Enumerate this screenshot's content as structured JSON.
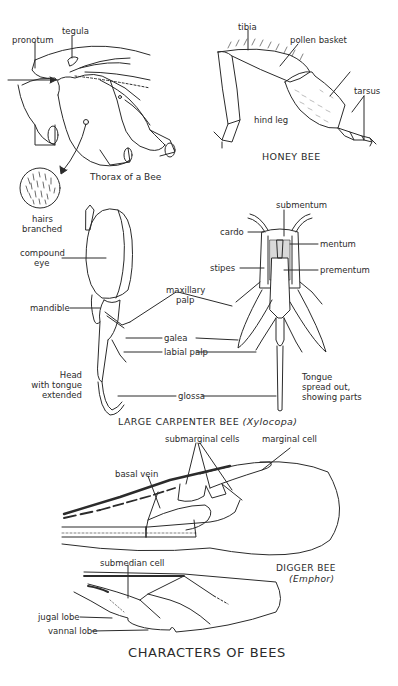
{
  "figure": {
    "title": "CHARACTERS OF BEES",
    "line_color": "#2b2b2b",
    "stipple_color": "#9a9a9a"
  },
  "thorax": {
    "labels": {
      "pronotum": "pronotum",
      "tegula": "tegula",
      "caption": "Thorax of a Bee",
      "hairs_line1": "hairs",
      "hairs_line2": "branched"
    }
  },
  "honey_bee": {
    "caption": "HONEY BEE",
    "labels": {
      "tibia": "tibia",
      "pollen_basket": "pollen basket",
      "tarsus": "tarsus",
      "hind_leg": "hind leg"
    }
  },
  "carpenter_bee": {
    "caption_prefix": "LARGE CARPENTER BEE",
    "caption_genus": "(Xylocopa)",
    "head_labels": {
      "compound_eye_1": "compound",
      "compound_eye_2": "eye",
      "mandible": "mandible",
      "head_1": "Head",
      "head_2": "with tongue",
      "head_3": "extended"
    },
    "shared_labels": {
      "maxillary_palp_1": "maxillary",
      "maxillary_palp_2": "palp",
      "galea": "galea",
      "labial_palp": "labial palp",
      "glossa": "glossa"
    },
    "tongue_labels": {
      "submentum": "submentum",
      "cardo": "cardo",
      "mentum": "mentum",
      "stipes": "stipes",
      "prementum": "prementum",
      "tongue_1": "Tongue",
      "tongue_2": "spread out,",
      "tongue_3": "showing parts"
    }
  },
  "digger_bee": {
    "caption_1": "DIGGER BEE",
    "caption_2": "(Emphor)",
    "forewing_labels": {
      "submarginal_cells": "submarginal cells",
      "marginal_cell": "marginal cell",
      "basal_vein": "basal vein"
    },
    "hindwing_labels": {
      "submedian_cell": "submedian cell",
      "jugal_lobe": "jugal lobe",
      "vannal_lobe": "vannal lobe"
    }
  }
}
